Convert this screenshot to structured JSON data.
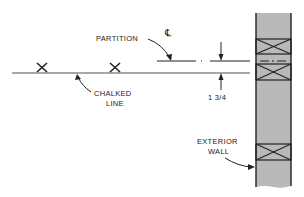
{
  "diagram": {
    "labels": {
      "partition": "PARTITION",
      "centerline_symbol": "℄",
      "chalked_line_1": "CHALKED",
      "chalked_line_2": "LINE",
      "dimension": "1 3/4",
      "exterior_wall_1": "EXTERIOR",
      "exterior_wall_2": "WALL"
    },
    "colors": {
      "line": "#222222",
      "chalked_line": "#8a8a8a",
      "wall_fill": "#b9b9b9",
      "background": "#ffffff"
    },
    "marks": [
      {
        "type": "x-mark",
        "x": 42,
        "y": 68
      },
      {
        "type": "x-mark",
        "x": 115,
        "y": 68
      }
    ]
  }
}
